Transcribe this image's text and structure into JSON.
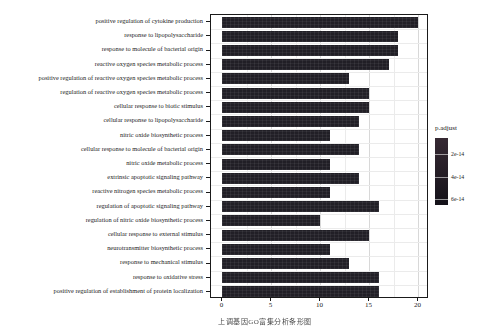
{
  "figure": {
    "caption": "上调基因GO富集分析条形图"
  },
  "chart_data": {
    "type": "bar",
    "orientation": "horizontal",
    "title": "",
    "xlabel": "",
    "ylabel": "",
    "xlim": [
      -1.1,
      21.1
    ],
    "x_ticks": [
      0,
      5,
      10,
      15,
      20
    ],
    "grid": {
      "major_x": [
        5,
        10,
        15,
        20
      ],
      "minor_x": [
        2.5,
        7.5,
        12.5,
        17.5
      ]
    },
    "categories": [
      "positive regulation of cytokine production",
      "response to lipopolysaccharide",
      "response to molecule of bacterial origin",
      "reactive oxygen species metabolic process",
      "positive regulation of reactive oxygen species metabolic process",
      "regulation of reactive oxygen species metabolic process",
      "cellular response to biotic stimulus",
      "cellular response to lipopolysaccharide",
      "nitric oxide biosynthetic process",
      "cellular response to molecule of bacterial origin",
      "nitric oxide metabolic process",
      "extrinsic apoptotic signaling pathway",
      "reactive nitrogen species metabolic process",
      "regulation of apoptotic signaling pathway",
      "regulation of nitric oxide biosynthetic process",
      "cellular response to external stimulus",
      "neurotransmitter biosynthetic process",
      "response to mechanical stimulus",
      "response to oxidative stress",
      "positive regulation of establishment of protein localization"
    ],
    "values": [
      20,
      18,
      18,
      17,
      13,
      15,
      15,
      14,
      11,
      14,
      11,
      14,
      11,
      16,
      10,
      15,
      11,
      13,
      16,
      16
    ],
    "colors": {
      "bar": "#211f26",
      "panel_border": "#1a1a1a",
      "grid_major": "#d8d8d8",
      "grid_minor": "#ebebeb",
      "text": "#1c1c1c"
    },
    "legend": {
      "title": "p.adjust",
      "position": "right",
      "gradient": [
        "#362933",
        "#141219"
      ],
      "ticks": [
        {
          "label": "2e-14",
          "pos": 0.24
        },
        {
          "label": "4e-14",
          "pos": 0.58
        },
        {
          "label": "6e-14",
          "pos": 0.91
        }
      ]
    }
  }
}
